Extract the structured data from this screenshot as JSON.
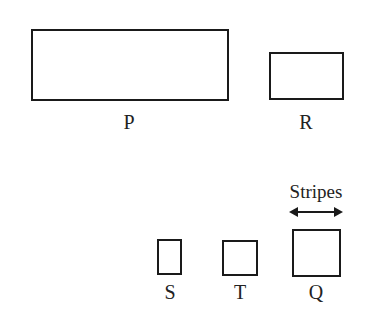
{
  "diagram": {
    "shapes": [
      {
        "id": "P",
        "label": "P",
        "x": 31,
        "y": 29,
        "w": 198,
        "h": 72
      },
      {
        "id": "R",
        "label": "R",
        "x": 269,
        "y": 52,
        "w": 75,
        "h": 48
      },
      {
        "id": "S",
        "label": "S",
        "x": 157,
        "y": 239,
        "w": 25,
        "h": 36
      },
      {
        "id": "T",
        "label": "T",
        "x": 222,
        "y": 240,
        "w": 36,
        "h": 36
      },
      {
        "id": "Q",
        "label": "Q",
        "x": 292,
        "y": 229,
        "w": 48,
        "h": 48
      }
    ],
    "annotation": {
      "text": "Stripes",
      "direction": "horizontal double-headed arrow",
      "applies_to": "Q"
    },
    "stroke_color": "#1a1a1a",
    "background": "#ffffff"
  }
}
